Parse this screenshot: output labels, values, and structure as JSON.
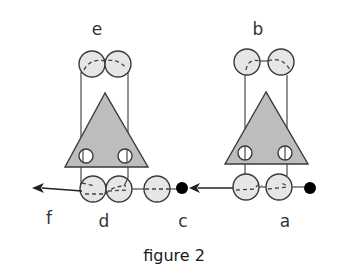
{
  "figure": {
    "caption": "figure 2",
    "labels": {
      "a": "a",
      "b": "b",
      "c": "c",
      "d": "d",
      "e": "e",
      "f": "f"
    },
    "colors": {
      "triangle_fill": "#bdbdbd",
      "circle_fill": "#e6e6e6",
      "hole_fill": "#ffffff",
      "outline": "#3a3a3a",
      "dot": "#000000"
    },
    "groups": [
      {
        "name": "left-assembly",
        "top_label": "e",
        "bottom_label": "d",
        "arrow_label": "f",
        "arrow_direction": "left"
      },
      {
        "name": "right-assembly",
        "top_label": "b",
        "bottom_label": "a",
        "arrow_label": "c",
        "arrow_direction": "left"
      }
    ]
  }
}
